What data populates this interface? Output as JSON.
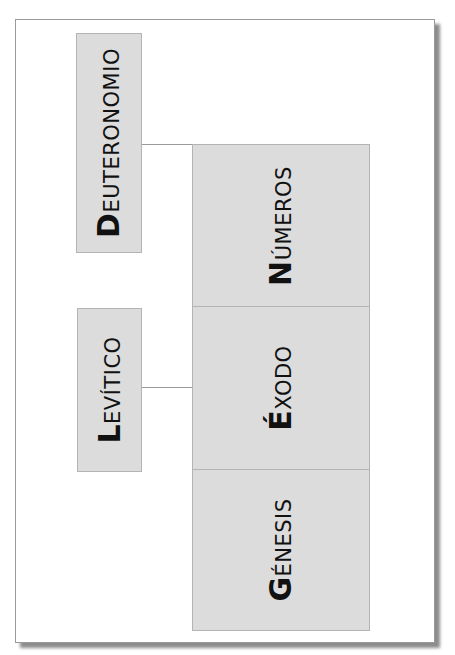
{
  "diagram": {
    "title": "",
    "colors": {
      "box_fill": "#dcdcdc",
      "box_border": "#b4b4b4",
      "connector": "#9a9a9a",
      "text": "#111111"
    },
    "stack": [
      {
        "id": "numeros",
        "cap": "N",
        "rest": "ÚMEROS",
        "full": "Números"
      },
      {
        "id": "exodo",
        "cap": "É",
        "rest": "XODO",
        "full": "Éxodo"
      },
      {
        "id": "genesis",
        "cap": "G",
        "rest": "ÉNESIS",
        "full": "Génesis"
      }
    ],
    "side": [
      {
        "id": "deuteronomio",
        "cap": "D",
        "rest": "EUTERONOMIO",
        "full": "Deuteronomio",
        "connects_to": "numeros"
      },
      {
        "id": "levitico",
        "cap": "L",
        "rest": "EVÍTICO",
        "full": "Levítico",
        "connects_to": "exodo"
      }
    ]
  }
}
